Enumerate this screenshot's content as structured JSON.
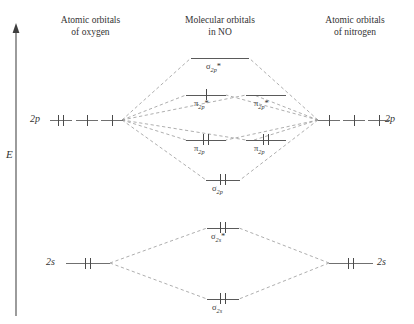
{
  "headers": {
    "left": "Atomic orbitals\nof oxygen",
    "center": "Molecular orbitals\nin NO",
    "right": "Atomic orbitals\nof nitrogen"
  },
  "axis": {
    "label": "E",
    "name": "energy-axis"
  },
  "atomic": {
    "oxygen": {
      "p_label": "2p",
      "s_label": "2s",
      "p_electrons": [
        2,
        1,
        1
      ],
      "s_electrons": 2
    },
    "nitrogen": {
      "p_label": "2p",
      "s_label": "2s",
      "p_electrons": [
        1,
        1,
        1
      ],
      "s_electrons": 2
    }
  },
  "molecular_orbitals": [
    {
      "id": "sigma2p-star",
      "label": "σ",
      "sub": "2p",
      "star": "*",
      "electrons": 0
    },
    {
      "id": "pi2p-star-left",
      "label": "π",
      "sub": "2p",
      "star": "*",
      "electrons": 1
    },
    {
      "id": "pi2p-star-right",
      "label": "π",
      "sub": "2p",
      "star": "*",
      "electrons": 0
    },
    {
      "id": "pi2p-left",
      "label": "π",
      "sub": "2p",
      "star": "",
      "electrons": 2
    },
    {
      "id": "pi2p-right",
      "label": "π",
      "sub": "2p",
      "star": "",
      "electrons": 2
    },
    {
      "id": "sigma2p",
      "label": "σ",
      "sub": "2p",
      "star": "",
      "electrons": 2
    },
    {
      "id": "sigma2s-star",
      "label": "σ",
      "sub": "2s",
      "star": "*",
      "electrons": 2
    },
    {
      "id": "sigma2s",
      "label": "σ",
      "sub": "2s",
      "star": "",
      "electrons": 2
    }
  ],
  "colors": {
    "line": "#707070",
    "dashed": "#8a8a8a",
    "text": "#333333"
  }
}
